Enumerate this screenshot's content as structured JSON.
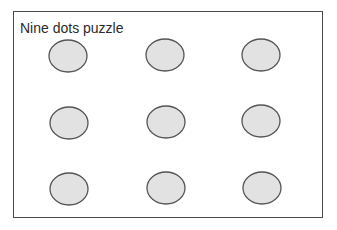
{
  "title": "Nine dots puzzle",
  "colors": {
    "border": "#4a4a4a",
    "dot_fill": "#e2e2e2",
    "dot_stroke": "#555555",
    "background": "#ffffff"
  },
  "dots": [
    {
      "row": 1,
      "col": 1,
      "cx": 68,
      "cy": 56
    },
    {
      "row": 1,
      "col": 2,
      "cx": 165,
      "cy": 55
    },
    {
      "row": 1,
      "col": 3,
      "cx": 261,
      "cy": 55
    },
    {
      "row": 2,
      "col": 1,
      "cx": 69,
      "cy": 123
    },
    {
      "row": 2,
      "col": 2,
      "cx": 166,
      "cy": 122
    },
    {
      "row": 2,
      "col": 3,
      "cx": 261,
      "cy": 121
    },
    {
      "row": 3,
      "col": 1,
      "cx": 69,
      "cy": 189
    },
    {
      "row": 3,
      "col": 2,
      "cx": 166,
      "cy": 188
    },
    {
      "row": 3,
      "col": 3,
      "cx": 262,
      "cy": 188
    }
  ],
  "dot_size": {
    "rx": 19,
    "ry": 16
  }
}
